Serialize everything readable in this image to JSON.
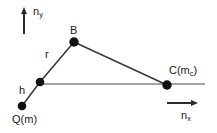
{
  "figure": {
    "background_color": "#ffffff",
    "line_color": "#3a3a3a",
    "node_color": "#111111",
    "text_color": "#1a1a1a"
  },
  "axes": {
    "vertical": {
      "name": "n_y",
      "label_text": "n",
      "label_sub": "y",
      "direction": "up",
      "arrow": {
        "x1": 24,
        "y1": 34,
        "x2": 24,
        "y2": 10
      }
    },
    "horizontal": {
      "name": "n_x",
      "label_text": "n",
      "label_sub": "x",
      "direction": "right",
      "arrow": {
        "x1": 167,
        "y1": 103,
        "x2": 197,
        "y2": 103
      }
    }
  },
  "nodes": [
    {
      "id": "Q",
      "label_text": "Q(m)",
      "label_sub": "",
      "x": 22,
      "y": 106,
      "radius": 4.2
    },
    {
      "id": "H",
      "label_text": "",
      "label_sub": "",
      "x": 40,
      "y": 82,
      "radius": 4.2
    },
    {
      "id": "B",
      "label_text": "B",
      "label_sub": "",
      "x": 74,
      "y": 42,
      "radius": 4.6
    },
    {
      "id": "C",
      "label_text": "C(m",
      "label_sub": "c",
      "x": 167,
      "y": 85,
      "radius": 4.6
    }
  ],
  "segments": [
    {
      "name": "h-segment",
      "label": "h",
      "from": "Q",
      "to": "H",
      "x1": 22,
      "y1": 106,
      "x2": 40,
      "y2": 82
    },
    {
      "name": "r-segment",
      "label": "r",
      "from": "H",
      "to": "B",
      "x1": 40,
      "y1": 82,
      "x2": 74,
      "y2": 42
    },
    {
      "name": "b-c-segment",
      "label": "",
      "from": "B",
      "to": "C",
      "x1": 74,
      "y1": 42,
      "x2": 167,
      "y2": 85
    },
    {
      "name": "baseline-segment",
      "label": "",
      "from": "H",
      "to": "C",
      "x1": 40,
      "y1": 84,
      "x2": 205,
      "y2": 84
    }
  ],
  "labels": {
    "node_B": "B",
    "node_Q": "Q(m)",
    "node_C_main": "C(m",
    "node_C_sub": "c",
    "node_C_close": ")",
    "length_r": "r",
    "length_h": "h",
    "axis_n": "n",
    "axis_y_sub": "y",
    "axis_x_sub": "x"
  }
}
